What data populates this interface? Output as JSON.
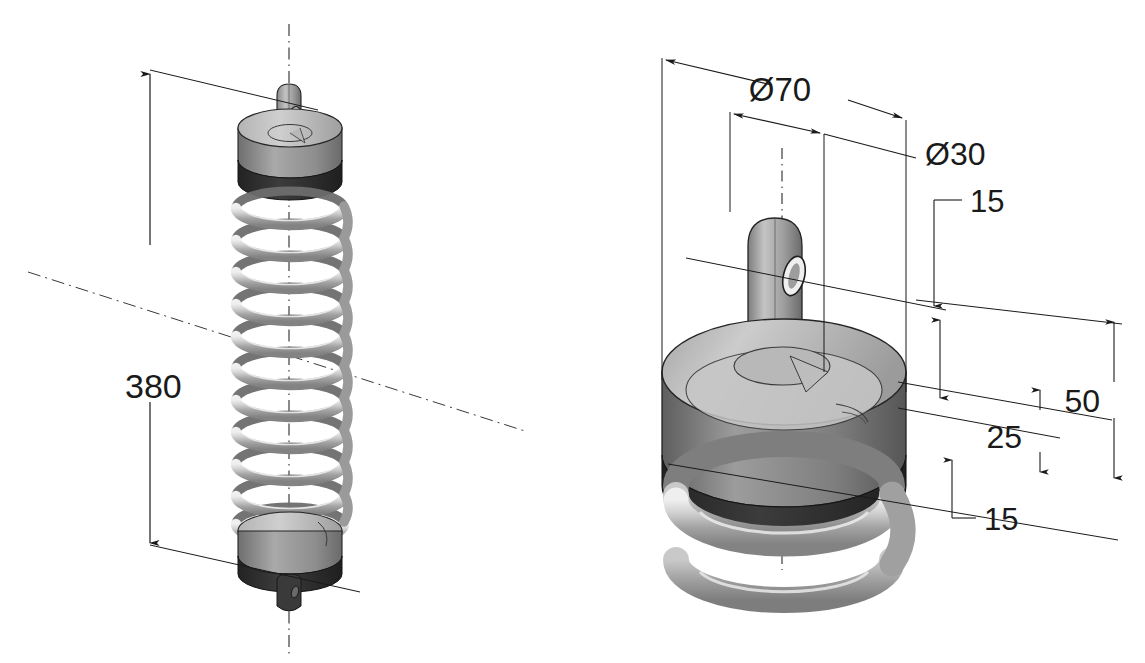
{
  "drawing": {
    "title": "Coil spring assembly - isometric views with dimensions",
    "background_color": "#ffffff",
    "line_color": "#1a1a1a",
    "units_note": "",
    "views": [
      {
        "id": "assembly-view",
        "name": "Full spring assembly isometric view",
        "position": "left",
        "components": [
          "top eyelet lug",
          "top cap disc",
          "dark rim band",
          "helical coil spring",
          "bottom cap disc",
          "bottom eyelet lug"
        ],
        "coil_count": 11
      },
      {
        "id": "detail-view",
        "name": "Top cap detail isometric view",
        "position": "right",
        "components": [
          "eyelet lug with through hole",
          "cap disc top face",
          "cap disc side wall",
          "dark rim band",
          "upper spring coils"
        ],
        "coil_count": 2
      }
    ],
    "dimensions": [
      {
        "id": "dim-380",
        "label": "380",
        "view": "assembly-view",
        "type": "linear-vertical",
        "feature": "overall free length"
      },
      {
        "id": "dim-d70",
        "label": "Ø70",
        "view": "detail-view",
        "type": "diameter",
        "feature": "cap disc outer diameter"
      },
      {
        "id": "dim-d30",
        "label": "Ø30",
        "view": "detail-view",
        "type": "diameter",
        "feature": "eyelet lug diameter"
      },
      {
        "id": "dim-15-top",
        "label": "15",
        "view": "detail-view",
        "type": "linear-vertical",
        "feature": "eyelet hole height"
      },
      {
        "id": "dim-50",
        "label": "50",
        "view": "detail-view",
        "type": "linear-vertical",
        "feature": "overall cap height"
      },
      {
        "id": "dim-25",
        "label": "25",
        "view": "detail-view",
        "type": "linear-vertical",
        "feature": "disc top to rim"
      },
      {
        "id": "dim-15-bottom",
        "label": "15",
        "view": "detail-view",
        "type": "linear-vertical",
        "feature": "rim band thickness"
      }
    ],
    "shading": {
      "face_light": "#c9c9c9",
      "face_mid": "#a8a8a8",
      "face_dark": "#878787",
      "rim_band": "#2e2e2e",
      "rim_band_mid": "#4a4a4a",
      "coil_light": "#cfcfcf",
      "coil_mid": "#a5a5a5",
      "coil_dark": "#8c8c8c",
      "outline": "#1a1a1a"
    },
    "centerlines": [
      {
        "id": "cl-vertical-assembly",
        "style": "dash-dot",
        "orientation": "vertical"
      },
      {
        "id": "cl-diagonal-assembly",
        "style": "dash-dot",
        "orientation": "diagonal"
      },
      {
        "id": "cl-vertical-detail",
        "style": "dash-dot",
        "orientation": "vertical"
      }
    ]
  }
}
